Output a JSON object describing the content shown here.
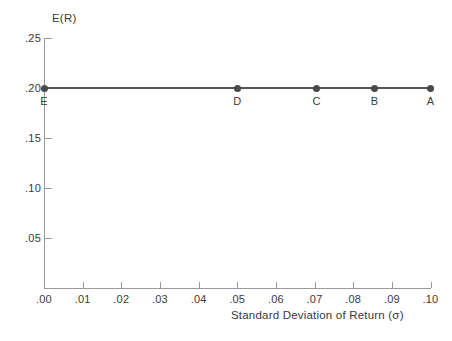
{
  "chart_data": {
    "type": "line",
    "title": "",
    "xlabel": "Standard Deviation of Return (σ)",
    "ylabel": "E(R)",
    "xlim": [
      0.0,
      0.1
    ],
    "ylim": [
      0.0,
      0.25
    ],
    "grid": false,
    "legend": "none",
    "x_ticks": [
      {
        "value": 0.0,
        "label": ".00"
      },
      {
        "value": 0.01,
        "label": ".01"
      },
      {
        "value": 0.02,
        "label": ".02"
      },
      {
        "value": 0.03,
        "label": ".03"
      },
      {
        "value": 0.04,
        "label": ".04"
      },
      {
        "value": 0.05,
        "label": ".05"
      },
      {
        "value": 0.06,
        "label": ".06"
      },
      {
        "value": 0.07,
        "label": ".07"
      },
      {
        "value": 0.08,
        "label": ".08"
      },
      {
        "value": 0.09,
        "label": ".09"
      },
      {
        "value": 0.1,
        "label": ".10"
      }
    ],
    "y_ticks": [
      {
        "value": 0.25,
        "label": ".25"
      },
      {
        "value": 0.2,
        "label": ".20"
      },
      {
        "value": 0.15,
        "label": ".15"
      },
      {
        "value": 0.1,
        "label": ".10"
      },
      {
        "value": 0.05,
        "label": ".05"
      }
    ],
    "series": [
      {
        "name": "portfolio-line",
        "color": "#555555",
        "points": [
          {
            "label": "E",
            "x": 0.0,
            "y": 0.2
          },
          {
            "label": "D",
            "x": 0.05,
            "y": 0.2
          },
          {
            "label": "C",
            "x": 0.0705,
            "y": 0.2
          },
          {
            "label": "B",
            "x": 0.0855,
            "y": 0.2
          },
          {
            "label": "A",
            "x": 0.1,
            "y": 0.2
          }
        ]
      }
    ]
  },
  "colors": {
    "series": "#555555",
    "marker": "#4a4a4a",
    "axis": "#9a9a9a",
    "text": "#3a3a3a",
    "background": "#ffffff"
  }
}
